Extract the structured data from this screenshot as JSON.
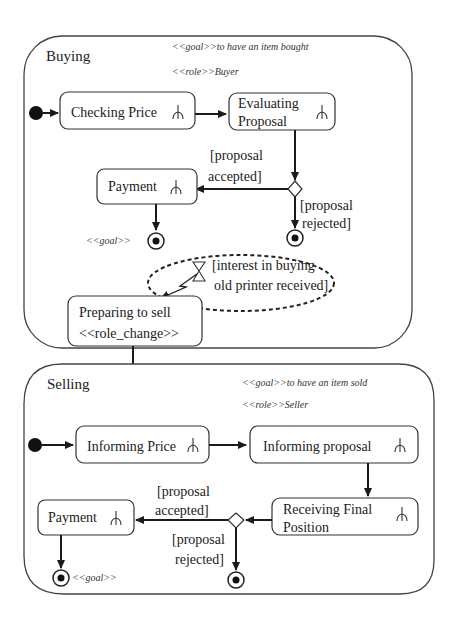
{
  "diagram": {
    "buying": {
      "title": "Buying",
      "goal_stereotype": "<<goal>>to have an item bought",
      "role_stereotype": "<<role>>Buyer",
      "states": {
        "checking_price": "Checking Price",
        "evaluating_proposal_line1": "Evaluating",
        "evaluating_proposal_line2": "Proposal",
        "payment": "Payment",
        "preparing_line1": "Preparing to sell",
        "preparing_line2": "<<role_change>>"
      },
      "guards": {
        "accepted_line1": "[proposal",
        "accepted_line2": "accepted]",
        "rejected_line1": "[proposal",
        "rejected_line2": "rejected]"
      },
      "final_goal_label": "<<goal>>",
      "event": {
        "line1": "[interest in buying",
        "line2": "old printer received]"
      }
    },
    "selling": {
      "title": "Selling",
      "goal_stereotype": "<<goal>>to have an item sold",
      "role_stereotype": "<<role>>Seller",
      "states": {
        "informing_price": "Informing Price",
        "informing_proposal": "Informing proposal",
        "receiving_line1": "Receiving Final",
        "receiving_line2": "Position",
        "payment": "Payment"
      },
      "guards": {
        "accepted_line1": "[proposal",
        "accepted_line2": "accepted]",
        "rejected_line1": "[proposal",
        "rejected_line2": "rejected]"
      },
      "final_goal_label": "<<goal>>"
    }
  }
}
